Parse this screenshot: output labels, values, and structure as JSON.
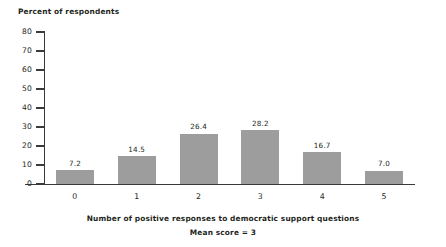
{
  "chart_data": {
    "type": "bar",
    "title": "",
    "categories": [
      "0",
      "1",
      "2",
      "3",
      "4",
      "5"
    ],
    "values": [
      7.2,
      14.5,
      26.4,
      28.2,
      16.7,
      7.0
    ],
    "value_labels": [
      "7.2",
      "14.5",
      "26.4",
      "28.2",
      "16.7",
      "7.0"
    ],
    "ylabel": "Percent of respondents",
    "xlabel": "Number of positive responses to democratic support questions",
    "subtitle": "Mean score = 3",
    "ylim": [
      0,
      80
    ],
    "ytick_values": [
      80,
      70,
      60,
      50,
      40,
      30,
      20,
      10,
      0
    ],
    "ytick_labels": [
      "80",
      "70",
      "60",
      "50",
      "40",
      "30",
      "20",
      "10",
      "0"
    ],
    "grid": false,
    "legend": false,
    "bar_color": "#9d9d9d",
    "axis_color": "#3a3a3a",
    "text_color": "#231f20",
    "background_color": "#ffffff"
  }
}
